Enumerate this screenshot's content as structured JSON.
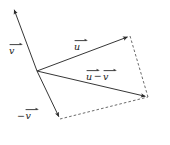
{
  "figure": {
    "type": "vector-diagram",
    "background_color": "#ffffff",
    "stroke_color": "#2b2b2b",
    "width": 170,
    "height": 145,
    "origin": {
      "x": 37,
      "y": 71
    },
    "vectors": [
      {
        "id": "v",
        "label": "v",
        "label_prefix": "",
        "accent": "right-arrow",
        "from": {
          "x": 37,
          "y": 71
        },
        "to": {
          "x": 13,
          "y": 7
        },
        "style": "solid",
        "arrowhead": true,
        "label_position": {
          "x": 9,
          "y": 42
        }
      },
      {
        "id": "neg-v",
        "label": "v",
        "label_prefix": "−",
        "accent": "right-arrow",
        "from": {
          "x": 37,
          "y": 71
        },
        "to": {
          "x": 60,
          "y": 119
        },
        "style": "solid",
        "arrowhead": true,
        "label_position": {
          "x": 17,
          "y": 107
        }
      },
      {
        "id": "u",
        "label": "u",
        "label_prefix": "",
        "accent": "right-arrow",
        "from": {
          "x": 37,
          "y": 71
        },
        "to": {
          "x": 130,
          "y": 36
        },
        "style": "solid",
        "arrowhead": true,
        "label_position": {
          "x": 74,
          "y": 38
        }
      },
      {
        "id": "u-minus-v",
        "label": "u − v",
        "label_left": "u",
        "label_operator": "−",
        "label_right": "v",
        "accent": "right-arrow",
        "from": {
          "x": 37,
          "y": 71
        },
        "to": {
          "x": 148,
          "y": 97
        },
        "style": "solid",
        "arrowhead": true,
        "label_position": {
          "x": 86,
          "y": 68
        }
      }
    ],
    "construction_lines": [
      {
        "id": "dashed-right-edge",
        "from": {
          "x": 130,
          "y": 36
        },
        "to": {
          "x": 148,
          "y": 97
        },
        "style": "dashed"
      },
      {
        "id": "dashed-bottom-edge",
        "from": {
          "x": 60,
          "y": 119
        },
        "to": {
          "x": 148,
          "y": 97
        },
        "style": "dashed"
      }
    ]
  }
}
